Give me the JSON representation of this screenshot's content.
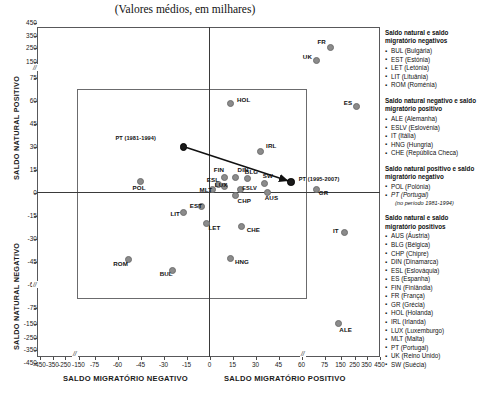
{
  "subtitle": "(Valores médios, em milhares)",
  "axes": {
    "y_top_label": "SALDO NATURAL POSITIVO",
    "y_bottom_label": "SALDO NATURAL NEGATIVO",
    "x_left_label": "SALDO MIGRATÓRIO NEGATIVO",
    "x_right_label": "SALDO MIGRATÓRIO POSITIVO",
    "break_symbol": "//"
  },
  "chart_data": {
    "type": "scatter",
    "title": "",
    "subtitle": "(Valores médios, em milhares)",
    "xlabel": "SALDO MIGRATÓRIO",
    "ylabel": "SALDO NATURAL",
    "grid": false,
    "legend_position": "right",
    "xticks": [
      -450,
      -350,
      -250,
      -150,
      -75,
      -60,
      -45,
      -30,
      -15,
      0,
      15,
      30,
      45,
      60,
      75,
      150,
      250,
      350,
      450
    ],
    "yticks": [
      450,
      350,
      250,
      150,
      75,
      60,
      45,
      30,
      15,
      0,
      -15,
      -30,
      -45,
      -60,
      -75,
      -150,
      -250,
      -350,
      -450
    ],
    "xlim": [
      -450,
      450
    ],
    "ylim": [
      -450,
      450
    ],
    "axis_note": "Eixos com escala descontínua (quebra '//' entre 75 e 150 e entre -75 e -150)",
    "points": [
      {
        "label": "FR",
        "x": 103,
        "y": 247
      },
      {
        "label": "UK",
        "x": 70,
        "y": 160
      },
      {
        "label": "ES",
        "x": 269,
        "y": 56
      },
      {
        "label": "HOL",
        "x": 14,
        "y": 58
      },
      {
        "label": "IRL",
        "x": 33,
        "y": 27
      },
      {
        "label": "PT (1981-1994)",
        "x": -17,
        "y": 30,
        "highlight": true
      },
      {
        "label": "PT (1995-2007)",
        "x": 53,
        "y": 7,
        "highlight": true
      },
      {
        "label": "POL",
        "x": -45,
        "y": 7
      },
      {
        "label": "BLG",
        "x": 25,
        "y": 9
      },
      {
        "label": "SW",
        "x": 36,
        "y": 6
      },
      {
        "label": "GR",
        "x": 70,
        "y": 2
      },
      {
        "label": "AUS",
        "x": 38,
        "y": 0
      },
      {
        "label": "FIN",
        "x": 10,
        "y": 10
      },
      {
        "label": "DIN",
        "x": 17,
        "y": 10
      },
      {
        "label": "ESL",
        "x": 6,
        "y": 5
      },
      {
        "label": "LUX",
        "x": 10,
        "y": 4
      },
      {
        "label": "MLT",
        "x": 2,
        "y": 2
      },
      {
        "label": "ESLV",
        "x": 20,
        "y": 2
      },
      {
        "label": "CHP",
        "x": 17,
        "y": -2
      },
      {
        "label": "EST",
        "x": -5,
        "y": -9
      },
      {
        "label": "LIT",
        "x": -17,
        "y": -13
      },
      {
        "label": "LET",
        "x": -2,
        "y": -20
      },
      {
        "label": "CHE",
        "x": 21,
        "y": -22
      },
      {
        "label": "IT",
        "x": 175,
        "y": -26
      },
      {
        "label": "HNG",
        "x": 14,
        "y": -43
      },
      {
        "label": "ROM",
        "x": -53,
        "y": -44
      },
      {
        "label": "BUL",
        "x": -24,
        "y": -51
      },
      {
        "label": "ALE",
        "x": 140,
        "y": -150
      }
    ],
    "annotation_arrow": {
      "from_label": "PT (1981-1994)",
      "to_label": "PT (1995-2007)"
    }
  },
  "legend": [
    {
      "heading": "Saldo natural e saldo migratório negativos",
      "items": [
        {
          "text": "BUL (Bulgária)"
        },
        {
          "text": "EST (Estónia)"
        },
        {
          "text": "LET (Letónia)"
        },
        {
          "text": "LIT (Lituânia)"
        },
        {
          "text": "ROM (Roménia)"
        }
      ]
    },
    {
      "heading": "Saldo natural negativo e saldo migratório positivo",
      "items": [
        {
          "text": "ALE (Alemanha)"
        },
        {
          "text": "ESLV (Eslovénia)"
        },
        {
          "text": "IT (Itália)"
        },
        {
          "text": "HNG (Hungria)"
        },
        {
          "text": "CHE (República Checa)"
        }
      ]
    },
    {
      "heading": "Saldo natural positivo e saldo migratório negativo",
      "items": [
        {
          "text": "POL (Polónia)"
        },
        {
          "text": "PT (Portugal)",
          "italic": true
        }
      ],
      "note": "(no período 1981-1994)"
    },
    {
      "heading": "Saldo natural e saldo migratório positivos",
      "items": [
        {
          "text": "AUS (Áustria)"
        },
        {
          "text": "BLG (Bélgica)"
        },
        {
          "text": "CHP (Chipre)"
        },
        {
          "text": "DIN (Dinamarca)"
        },
        {
          "text": "ESL (Eslováquia)"
        },
        {
          "text": "ES (Espanha)"
        },
        {
          "text": "FIN (Finlândia)"
        },
        {
          "text": "FR (França)"
        },
        {
          "text": "GR (Grécia)"
        },
        {
          "text": "HOL (Holanda)"
        },
        {
          "text": "IRL (Irlanda)"
        },
        {
          "text": "LUX (Luxemburgo)"
        },
        {
          "text": "MLT (Malta)"
        },
        {
          "text": "PT (Portugal)"
        },
        {
          "text": "UK (Reino Unido)"
        },
        {
          "text": "SW (Suécia)"
        }
      ]
    }
  ]
}
